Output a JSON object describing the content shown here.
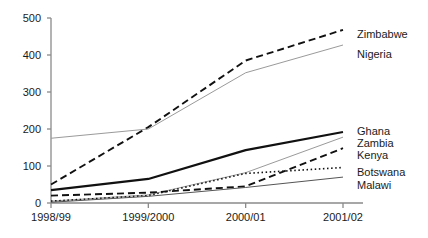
{
  "chart_data": {
    "type": "line",
    "title": "",
    "xlabel": "",
    "ylabel": "",
    "categories": [
      "1998/99",
      "1999/2000",
      "2000/01",
      "2001/02"
    ],
    "ylim": [
      0,
      500
    ],
    "yticks": [
      0,
      100,
      200,
      300,
      400,
      500
    ],
    "grid": false,
    "legend_position": "right-inline",
    "series": [
      {
        "name": "Zimbabwe",
        "values": [
          50,
          205,
          385,
          468
        ],
        "style": "dashed",
        "color": "#111111",
        "width": 1.9,
        "label_y": 29
      },
      {
        "name": "Nigeria",
        "values": [
          175,
          200,
          352,
          427
        ],
        "style": "solid",
        "color": "#9a9a9a",
        "width": 1.0,
        "label_y": 49
      },
      {
        "name": "Ghana",
        "values": [
          35,
          65,
          143,
          192
        ],
        "style": "solid",
        "color": "#111111",
        "width": 2.2,
        "label_y": 126
      },
      {
        "name": "Zambia",
        "values": [
          5,
          22,
          82,
          178
        ],
        "style": "solid",
        "color": "#9a9a9a",
        "width": 1.0,
        "label_y": 138
      },
      {
        "name": "Kenya",
        "values": [
          20,
          28,
          45,
          148
        ],
        "style": "dashed",
        "color": "#111111",
        "width": 1.9,
        "label_y": 150
      },
      {
        "name": "Botswana",
        "values": [
          5,
          20,
          80,
          96
        ],
        "style": "dotted",
        "color": "#111111",
        "width": 1.6,
        "label_y": 167
      },
      {
        "name": "Malawi",
        "values": [
          2,
          18,
          42,
          70
        ],
        "style": "solid",
        "color": "#555555",
        "width": 1.0,
        "label_y": 180
      }
    ],
    "axis": {
      "color": "#8a8a8a",
      "x0": 51,
      "x1": 343,
      "y0": 203,
      "y_top": 18
    }
  }
}
